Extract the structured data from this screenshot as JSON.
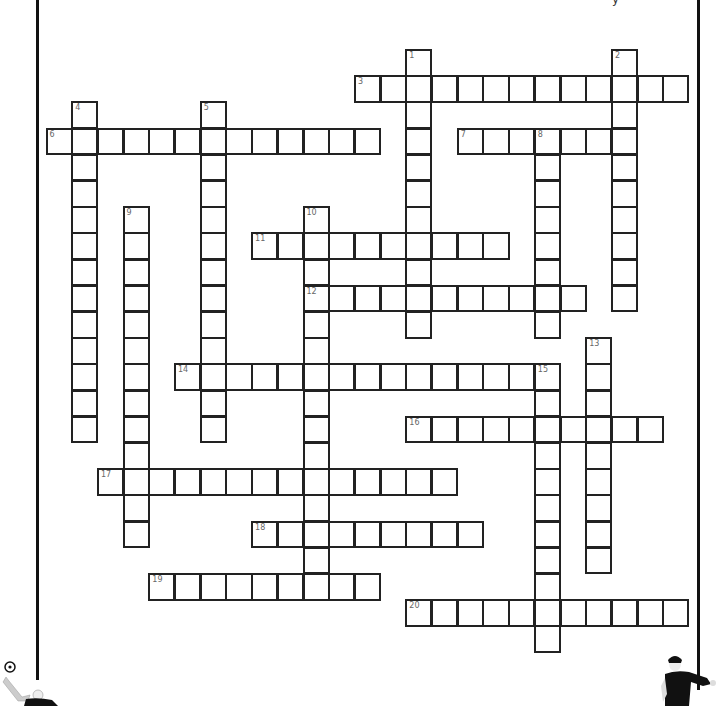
{
  "puzzle": {
    "type": "crossword",
    "title_partial": "y",
    "grid": {
      "x0": 45.5,
      "y0": 49,
      "cell_w": 25.7,
      "cell_h": 26.2
    },
    "words": [
      {
        "number": 1,
        "direction": "down",
        "col": 14,
        "row": 0,
        "length": 11
      },
      {
        "number": 2,
        "direction": "down",
        "col": 22,
        "row": 0,
        "length": 10
      },
      {
        "number": 3,
        "direction": "across",
        "col": 12,
        "row": 1,
        "length": 13
      },
      {
        "number": 4,
        "direction": "down",
        "col": 1,
        "row": 2,
        "length": 13
      },
      {
        "number": 5,
        "direction": "down",
        "col": 6,
        "row": 2,
        "length": 13
      },
      {
        "number": 6,
        "direction": "across",
        "col": 0,
        "row": 3,
        "length": 13
      },
      {
        "number": 7,
        "direction": "across",
        "col": 16,
        "row": 3,
        "length": 7
      },
      {
        "number": 8,
        "direction": "down",
        "col": 19,
        "row": 3,
        "length": 8
      },
      {
        "number": 9,
        "direction": "down",
        "col": 3,
        "row": 6,
        "length": 13
      },
      {
        "number": 10,
        "direction": "down",
        "col": 10,
        "row": 6,
        "length": 15
      },
      {
        "number": 11,
        "direction": "across",
        "col": 8,
        "row": 7,
        "length": 10
      },
      {
        "number": 12,
        "direction": "across",
        "col": 10,
        "row": 9,
        "length": 11
      },
      {
        "number": 13,
        "direction": "down",
        "col": 21,
        "row": 11,
        "length": 9
      },
      {
        "number": 14,
        "direction": "across",
        "col": 5,
        "row": 12,
        "length": 15
      },
      {
        "number": 15,
        "direction": "down",
        "col": 19,
        "row": 12,
        "length": 11
      },
      {
        "number": 16,
        "direction": "across",
        "col": 14,
        "row": 14,
        "length": 10
      },
      {
        "number": 17,
        "direction": "across",
        "col": 2,
        "row": 16,
        "length": 14
      },
      {
        "number": 18,
        "direction": "across",
        "col": 8,
        "row": 18,
        "length": 9
      },
      {
        "number": 19,
        "direction": "across",
        "col": 4,
        "row": 20,
        "length": 9
      },
      {
        "number": 20,
        "direction": "across",
        "col": 14,
        "row": 21,
        "length": 11
      }
    ],
    "decorations": [
      "soccer-goalkeeper-figure",
      "soccer-ball",
      "soccer-player-figure"
    ],
    "colors": {
      "cell_border": "#222222",
      "number_text": "#666666",
      "frame": "#111111"
    }
  }
}
